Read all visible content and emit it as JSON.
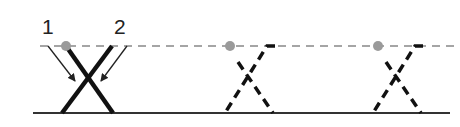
{
  "labels": {
    "one": "1",
    "two": "2"
  },
  "colors": {
    "line": "#1a1a1a",
    "dash": "#888888",
    "dot": "#9a9a9a",
    "baseline": "#333333"
  },
  "figure": {
    "panels": [
      {
        "name": "solid-crossing",
        "dot_x": 66,
        "style": "solid"
      },
      {
        "name": "dashed-crossing-2",
        "dot_x": 230,
        "style": "dashed"
      },
      {
        "name": "dashed-crossing-3",
        "dot_x": 377,
        "style": "dashed"
      }
    ]
  }
}
